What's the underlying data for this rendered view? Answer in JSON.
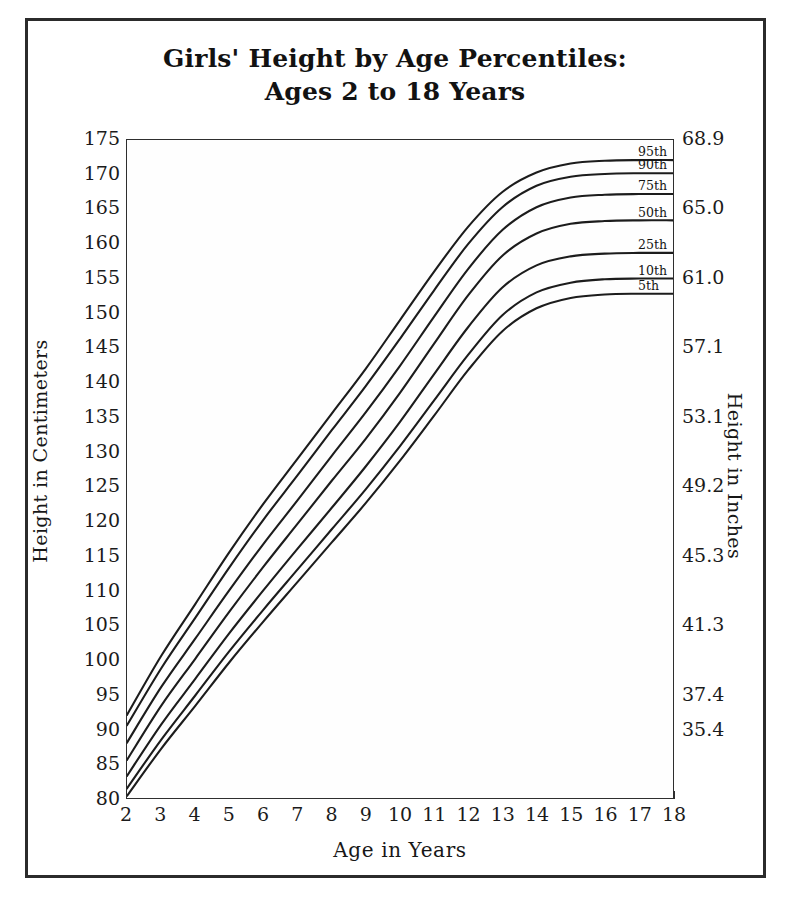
{
  "chart_data": {
    "type": "line",
    "title": "Girls' Height by Age Percentiles:",
    "subtitle": "Ages 2 to 18 Years",
    "xlabel": "Age in Years",
    "ylabel": "Height in Centimeters",
    "ylabel_right": "Height in Inches",
    "xlim": [
      2,
      18
    ],
    "ylim": [
      80,
      175
    ],
    "grid": false,
    "legend_position": "right-inline",
    "x": [
      2,
      3,
      4,
      5,
      6,
      7,
      8,
      9,
      10,
      11,
      12,
      13,
      14,
      15,
      16,
      17,
      18
    ],
    "xticks": [
      "2",
      "3",
      "4",
      "5",
      "6",
      "7",
      "8",
      "9",
      "10",
      "11",
      "12",
      "13",
      "14",
      "15",
      "16",
      "17",
      "18"
    ],
    "yticks_left": [
      "80",
      "85",
      "90",
      "95",
      "100",
      "105",
      "110",
      "115",
      "120",
      "125",
      "130",
      "135",
      "140",
      "145",
      "150",
      "155",
      "160",
      "165",
      "170",
      "175"
    ],
    "yticks_right": [
      {
        "label": "35.4",
        "cm": 90
      },
      {
        "label": "37.4",
        "cm": 95
      },
      {
        "label": "41.3",
        "cm": 105
      },
      {
        "label": "45.3",
        "cm": 115
      },
      {
        "label": "49.2",
        "cm": 125
      },
      {
        "label": "53.1",
        "cm": 135
      },
      {
        "label": "57.1",
        "cm": 145
      },
      {
        "label": "61.0",
        "cm": 155
      },
      {
        "label": "65.0",
        "cm": 165
      },
      {
        "label": "68.9",
        "cm": 175
      }
    ],
    "series": [
      {
        "name": "95th",
        "values": [
          92.0,
          100.5,
          108.0,
          115.5,
          122.5,
          129.0,
          135.5,
          142.0,
          149.0,
          156.0,
          162.5,
          167.5,
          170.3,
          171.6,
          172.0,
          172.1,
          172.1
        ]
      },
      {
        "name": "90th",
        "values": [
          90.5,
          98.7,
          106.0,
          113.3,
          120.2,
          126.6,
          133.1,
          139.5,
          146.3,
          153.3,
          160.0,
          165.3,
          168.4,
          169.7,
          170.1,
          170.2,
          170.2
        ]
      },
      {
        "name": "75th",
        "values": [
          88.0,
          96.0,
          103.0,
          110.0,
          116.7,
          123.0,
          129.4,
          135.7,
          142.4,
          149.5,
          156.4,
          162.0,
          165.3,
          166.7,
          167.1,
          167.2,
          167.2
        ]
      },
      {
        "name": "50th",
        "values": [
          85.5,
          93.3,
          100.1,
          106.9,
          113.4,
          119.6,
          125.8,
          131.9,
          138.5,
          145.6,
          152.6,
          158.3,
          161.5,
          162.9,
          163.3,
          163.4,
          163.4
        ]
      },
      {
        "name": "25th",
        "values": [
          83.2,
          90.6,
          97.2,
          103.8,
          110.0,
          116.0,
          121.9,
          127.9,
          134.3,
          141.2,
          148.0,
          153.7,
          156.9,
          158.2,
          158.6,
          158.7,
          158.7
        ]
      },
      {
        "name": "10th",
        "values": [
          81.4,
          88.4,
          94.8,
          101.2,
          107.2,
          113.0,
          118.8,
          124.6,
          130.8,
          137.4,
          144.0,
          149.7,
          153.0,
          154.4,
          154.9,
          155.0,
          155.0
        ]
      },
      {
        "name": "5th",
        "values": [
          80.3,
          87.1,
          93.3,
          99.6,
          105.5,
          111.2,
          116.9,
          122.6,
          128.7,
          135.2,
          141.8,
          147.4,
          150.7,
          152.2,
          152.7,
          152.8,
          152.8
        ]
      }
    ],
    "series_labels": [
      "95th",
      "90th",
      "75th",
      "50th",
      "25th",
      "10th",
      "5th"
    ],
    "line_color": "#1c1c1c",
    "background_color": "#ffffff",
    "frame_color": "#2b2b2b"
  }
}
